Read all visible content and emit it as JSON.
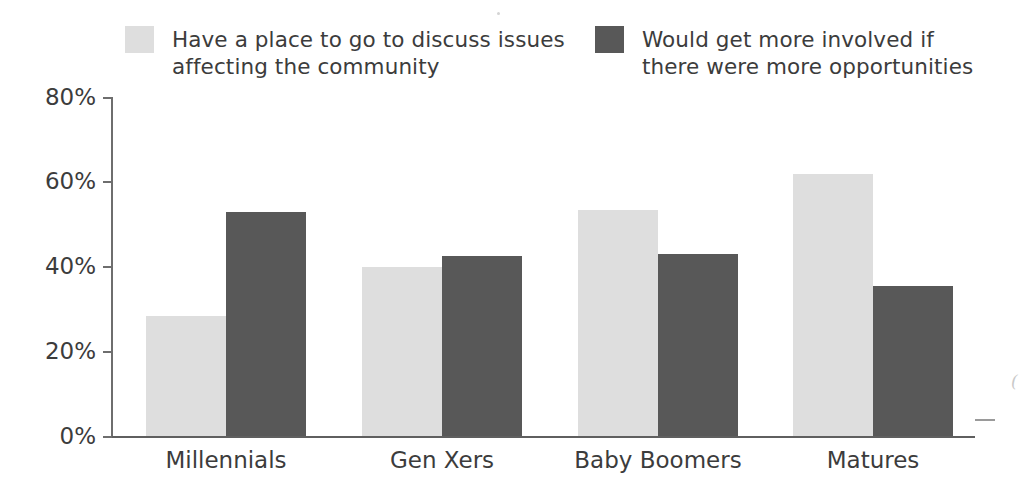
{
  "chart_data": {
    "type": "bar",
    "title": "",
    "subtitle": "",
    "xlabel": "",
    "ylabel": "",
    "ylim": [
      0,
      80
    ],
    "yticks": [
      "0%",
      "20%",
      "40%",
      "60%",
      "80%"
    ],
    "ytick_values": [
      0,
      20,
      40,
      60,
      80
    ],
    "grid": false,
    "legend_position": "top",
    "categories": [
      "Millennials",
      "Gen Xers",
      "Baby Boomers",
      "Matures"
    ],
    "series": [
      {
        "name": "Have a place to go to discuss issues\naffecting the community",
        "color": "#dedede",
        "values": [
          28.5,
          40.0,
          53.5,
          62.0
        ]
      },
      {
        "name": "Would get more involved if\nthere were more opportunities",
        "color": "#585858",
        "values": [
          53.0,
          42.5,
          43.0,
          35.5
        ]
      }
    ]
  },
  "legend": {
    "entries": [
      {
        "label": "Have a place to go to discuss issues\naffecting the community",
        "swatch_color": "#e3e3e3",
        "swatch_name": "legend-swatch-light"
      },
      {
        "label": "Would get more involved if\nthere were more opportunities",
        "swatch_color": "#585858",
        "swatch_name": "legend-swatch-dark"
      }
    ]
  },
  "edge_artifact": {
    "text": "("
  }
}
